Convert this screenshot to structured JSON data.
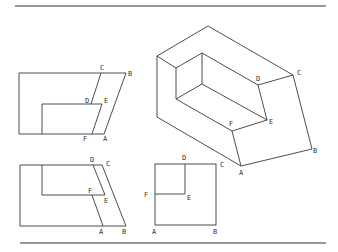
{
  "figure": {
    "views": {
      "front_view": {
        "labels": [
          {
            "text": "C",
            "x": 100,
            "y": 70
          },
          {
            "text": "B",
            "x": 128,
            "y": 76
          },
          {
            "text": "D",
            "x": 85,
            "y": 103
          },
          {
            "text": "E",
            "x": 104,
            "y": 103
          },
          {
            "text": "F",
            "x": 83,
            "y": 141
          },
          {
            "text": "A",
            "x": 103,
            "y": 141
          }
        ]
      },
      "side_view": {
        "labels": [
          {
            "text": "D",
            "x": 90,
            "y": 162
          },
          {
            "text": "C",
            "x": 106,
            "y": 166
          },
          {
            "text": "F",
            "x": 88,
            "y": 193
          },
          {
            "text": "E",
            "x": 104,
            "y": 203
          },
          {
            "text": "A",
            "x": 99,
            "y": 234
          },
          {
            "text": "B",
            "x": 122,
            "y": 234
          }
        ]
      },
      "top_view": {
        "labels": [
          {
            "text": "D",
            "x": 182,
            "y": 160
          },
          {
            "text": "C",
            "x": 220,
            "y": 167
          },
          {
            "text": "F",
            "x": 144,
            "y": 197
          },
          {
            "text": "E",
            "x": 187,
            "y": 200
          },
          {
            "text": "A",
            "x": 152,
            "y": 234
          },
          {
            "text": "B",
            "x": 213,
            "y": 234
          }
        ]
      },
      "isometric_view": {
        "labels": [
          {
            "text": "D",
            "x": 256,
            "y": 81
          },
          {
            "text": "C",
            "x": 297,
            "y": 75
          },
          {
            "text": "F",
            "x": 229,
            "y": 126
          },
          {
            "text": "E",
            "x": 269,
            "y": 124
          },
          {
            "text": "A",
            "x": 239,
            "y": 175
          },
          {
            "text": "B",
            "x": 313,
            "y": 153
          }
        ]
      }
    }
  }
}
